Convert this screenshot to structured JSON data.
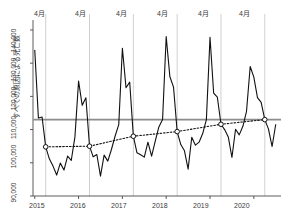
{
  "chart_data": {
    "type": "line",
    "title": "",
    "xlabel": "",
    "ylabel": "すべての原因による死亡数",
    "ylim": [
      90000,
      143000
    ],
    "xlim": [
      2014.96,
      2020.62
    ],
    "ytick_labels": [
      "90,000",
      "100,000",
      "110,000",
      "120,000",
      "130,000",
      "140,000"
    ],
    "ytick_values": [
      90000,
      100000,
      110000,
      120000,
      130000,
      140000
    ],
    "xtick_labels": [
      "2015",
      "2016",
      "2017",
      "2018",
      "2019",
      "2020"
    ],
    "xtick_values": [
      2015,
      2016,
      2017,
      2018,
      2019,
      2020
    ],
    "grid": "vertical-april-only",
    "legend": "none",
    "april_gridline_label": "4月",
    "april_gridline_labels": [
      "4月",
      "4月",
      "4月",
      "4月",
      "4月",
      "4月"
    ],
    "april_gridline_x": [
      2015.25,
      2016.25,
      2017.25,
      2018.25,
      2019.25,
      2020.25
    ],
    "reference_line": {
      "orientation": "horizontal",
      "value": 113000,
      "color": "#8c8c8c",
      "style": "solid"
    },
    "series": [
      {
        "name": "monthly_all_cause_deaths",
        "style": "solid",
        "color": "#111111",
        "x": [
          2015.0,
          2015.083,
          2015.167,
          2015.25,
          2015.333,
          2015.417,
          2015.5,
          2015.583,
          2015.667,
          2015.75,
          2015.833,
          2015.917,
          2016.0,
          2016.083,
          2016.167,
          2016.25,
          2016.333,
          2016.417,
          2016.5,
          2016.583,
          2016.667,
          2016.75,
          2016.833,
          2016.917,
          2017.0,
          2017.083,
          2017.167,
          2017.25,
          2017.333,
          2017.417,
          2017.5,
          2017.583,
          2017.667,
          2017.75,
          2017.833,
          2017.917,
          2018.0,
          2018.083,
          2018.167,
          2018.25,
          2018.333,
          2018.417,
          2018.5,
          2018.583,
          2018.667,
          2018.75,
          2018.833,
          2018.917,
          2019.0,
          2019.083,
          2019.167,
          2019.25,
          2019.333,
          2019.417,
          2019.5,
          2019.583,
          2019.667,
          2019.75,
          2019.833,
          2019.917,
          2020.0,
          2020.083,
          2020.167,
          2020.25,
          2020.333,
          2020.417,
          2020.5
        ],
        "values": [
          134000,
          113500,
          113800,
          104800,
          101200,
          99000,
          96300,
          99900,
          97800,
          102000,
          100700,
          107800,
          124600,
          117300,
          119600,
          105000,
          101800,
          102500,
          96000,
          102300,
          100500,
          104000,
          108000,
          111500,
          134500,
          122600,
          124300,
          108000,
          103000,
          102400,
          101700,
          106200,
          102000,
          106500,
          110800,
          113000,
          138000,
          126000,
          122800,
          109400,
          105500,
          103600,
          98100,
          107700,
          105300,
          106200,
          108800,
          113000,
          137800,
          121000,
          119800,
          111600,
          110000,
          107800,
          101600,
          110100,
          108400,
          111000,
          115500,
          129000,
          125800,
          119600,
          118200,
          113000,
          110200,
          104900,
          111600
        ]
      },
      {
        "name": "april_trend",
        "style": "dotted",
        "color": "#111111",
        "marker": "open-circle",
        "x": [
          2015.25,
          2016.25,
          2017.25,
          2018.25,
          2019.25,
          2020.25
        ],
        "values": [
          104800,
          105000,
          108000,
          109400,
          111600,
          113000
        ]
      }
    ]
  }
}
